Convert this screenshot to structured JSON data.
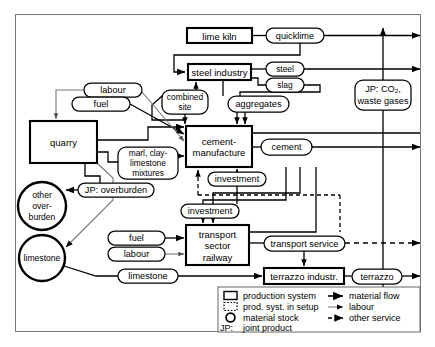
{
  "diagram": {
    "frame": {
      "x": 15,
      "y": 14,
      "w": 406,
      "h": 318
    }
  },
  "production_systems": [
    {
      "id": "lime-kiln",
      "label": "lime kiln",
      "x": 187,
      "y": 28,
      "w": 65,
      "h": 15
    },
    {
      "id": "steel-industry",
      "label": "steel industry",
      "x": 188,
      "y": 64,
      "w": 63,
      "h": 16
    },
    {
      "id": "quarry",
      "label": "quarry",
      "x": 30,
      "y": 121,
      "w": 67,
      "h": 42
    },
    {
      "id": "cement-manufacture",
      "label": "cement-\nmanufacture",
      "x": 186,
      "y": 126,
      "w": 66,
      "h": 41
    },
    {
      "id": "transport-sector",
      "label": "transport\nsector\nrailway",
      "x": 186,
      "y": 225,
      "w": 63,
      "h": 40
    },
    {
      "id": "terrazzo-industr",
      "label": "terrazzo industr.",
      "x": 264,
      "y": 268,
      "w": 80,
      "h": 16
    }
  ],
  "material_stocks": [
    {
      "id": "other-overburden",
      "label": "other\nover-\nburden",
      "cx": 42,
      "cy": 206,
      "r": 24
    },
    {
      "id": "limestone-stock",
      "label": "limestone",
      "cx": 42,
      "cy": 258,
      "r": 23
    }
  ],
  "flow_labels": [
    {
      "id": "quicklime",
      "label": "quicklime",
      "x": 266,
      "y": 28,
      "w": 58,
      "h": 15
    },
    {
      "id": "steel",
      "label": "steel",
      "x": 266,
      "y": 62,
      "w": 38,
      "h": 14
    },
    {
      "id": "slag",
      "label": "slag",
      "x": 266,
      "y": 78,
      "w": 38,
      "h": 14
    },
    {
      "id": "labour-quarry",
      "label": "labour",
      "x": 84,
      "y": 83,
      "w": 58,
      "h": 14
    },
    {
      "id": "fuel-quarry",
      "label": "fuel",
      "x": 72,
      "y": 97,
      "w": 58,
      "h": 14
    },
    {
      "id": "combined-site",
      "label": "combined\nsite",
      "x": 162,
      "y": 90,
      "w": 46,
      "h": 24
    },
    {
      "id": "aggregates",
      "label": "aggregates",
      "x": 228,
      "y": 96,
      "w": 61,
      "h": 16
    },
    {
      "id": "jp-co2",
      "label": "JP: CO₂,\nwaste gases",
      "x": 355,
      "y": 80,
      "w": 56,
      "h": 30
    },
    {
      "id": "marl-clay",
      "label": "marl, clay-\nlimestone\nmixtures",
      "x": 118,
      "y": 147,
      "w": 60,
      "h": 32
    },
    {
      "id": "cement",
      "label": "cement",
      "x": 261,
      "y": 139,
      "w": 51,
      "h": 16
    },
    {
      "id": "investment-1",
      "label": "investment",
      "x": 208,
      "y": 172,
      "w": 58,
      "h": 14
    },
    {
      "id": "jp-overburden",
      "label": "JP: overburden",
      "x": 78,
      "y": 183,
      "w": 76,
      "h": 14
    },
    {
      "id": "investment-2",
      "label": "investment",
      "x": 181,
      "y": 204,
      "w": 58,
      "h": 14
    },
    {
      "id": "fuel-transport",
      "label": "fuel",
      "x": 108,
      "y": 231,
      "w": 57,
      "h": 14
    },
    {
      "id": "labour-transport",
      "label": "labour",
      "x": 108,
      "y": 247,
      "w": 57,
      "h": 14
    },
    {
      "id": "transport-service",
      "label": "transport service",
      "x": 264,
      "y": 236,
      "w": 81,
      "h": 15
    },
    {
      "id": "limestone-flow",
      "label": "limestone",
      "x": 118,
      "y": 269,
      "w": 60,
      "h": 14
    },
    {
      "id": "terrazzo",
      "label": "terrazzo",
      "x": 352,
      "y": 269,
      "w": 50,
      "h": 15
    }
  ],
  "legend": {
    "box": {
      "x": 218,
      "y": 287,
      "w": 202,
      "h": 45
    },
    "left_items": [
      {
        "id": "legend-production-system",
        "label": "production system",
        "symbol": "solid-rect"
      },
      {
        "id": "legend-setup-system",
        "label": "prod. syst. in setup",
        "symbol": "dotted-rect"
      },
      {
        "id": "legend-material-stock",
        "label": "material stock",
        "symbol": "circle"
      },
      {
        "id": "legend-joint-product",
        "label": "joint product",
        "symbol": "jp-text",
        "prefix": "JP:"
      }
    ],
    "right_items": [
      {
        "id": "legend-material-flow",
        "label": "material flow",
        "symbol": "solid-arrow"
      },
      {
        "id": "legend-labour",
        "label": "labour",
        "symbol": "thin-arrow"
      },
      {
        "id": "legend-other-service",
        "label": "other service",
        "symbol": "dashed-arrow"
      }
    ]
  },
  "colors": {
    "ink": "#000000",
    "paper": "#ffffff",
    "thin_line": "#808080"
  }
}
